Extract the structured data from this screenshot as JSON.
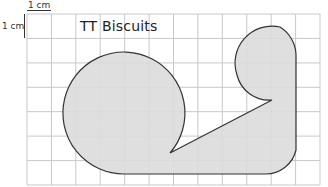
{
  "diagram": {
    "title": "TT Biscuits",
    "scale_horizontal_label": "1 cm",
    "scale_vertical_label": "1 cm",
    "grid": {
      "columns": 12,
      "rows": 7,
      "cell_size_cm": 1,
      "line_color": "#c8c8c8"
    },
    "shape": {
      "fill_color": "#dcdcdc",
      "stroke_color": "#333333",
      "description": "Composite biscuit shape: large circle (radius 3 cm) on left, small circle (radius 1.5 cm) top right, joined by a straight-edged body with rounded bottom-right corner and a curved notch cut-out"
    }
  }
}
